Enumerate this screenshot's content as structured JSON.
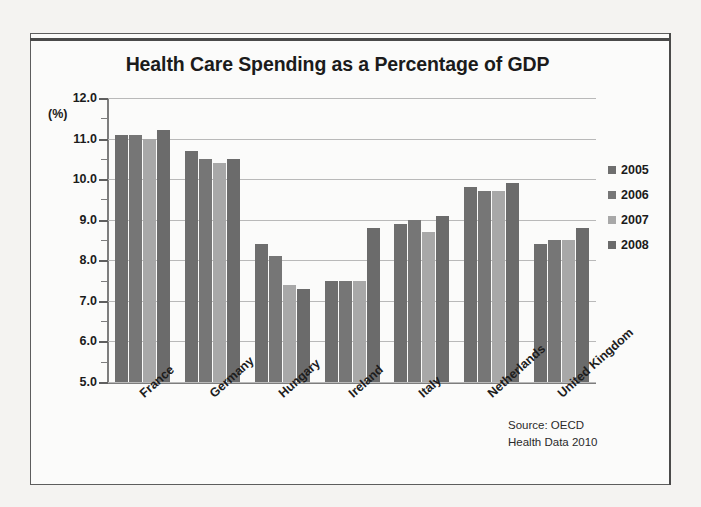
{
  "chart_data": {
    "type": "bar",
    "title": "Health Care Spending as a Percentage of GDP",
    "xlabel": "",
    "ylabel": "(%)",
    "ylim": [
      5.0,
      12.0
    ],
    "ytick_step": 1.0,
    "yminor_step": 0.5,
    "grid": true,
    "legend_position": "right",
    "categories": [
      "France",
      "Germany",
      "Hungary",
      "Ireland",
      "Italy",
      "Netherlands",
      "United Kingdom"
    ],
    "ytick_labels": [
      "12.0",
      "11.0",
      "10.0",
      "9.0",
      "8.0",
      "7.0",
      "6.0",
      "5.0"
    ],
    "series": [
      {
        "name": "2005",
        "color": "#6e6e6e",
        "values": [
          11.1,
          10.7,
          8.4,
          7.5,
          8.9,
          9.8,
          8.4
        ]
      },
      {
        "name": "2006",
        "color": "#767676",
        "values": [
          11.1,
          10.5,
          8.1,
          7.5,
          9.0,
          9.7,
          8.5
        ]
      },
      {
        "name": "2007",
        "color": "#a8a8a8",
        "values": [
          11.0,
          10.4,
          7.4,
          7.5,
          8.7,
          9.7,
          8.5
        ]
      },
      {
        "name": "2008",
        "color": "#6b6b6b",
        "values": [
          11.2,
          10.5,
          7.3,
          8.8,
          9.1,
          9.9,
          8.8
        ]
      }
    ],
    "annotations": [
      "Source: OECD",
      "Health Data 2010"
    ]
  },
  "source_note": {
    "line1": "Source: OECD",
    "line2": "Health Data 2010"
  }
}
